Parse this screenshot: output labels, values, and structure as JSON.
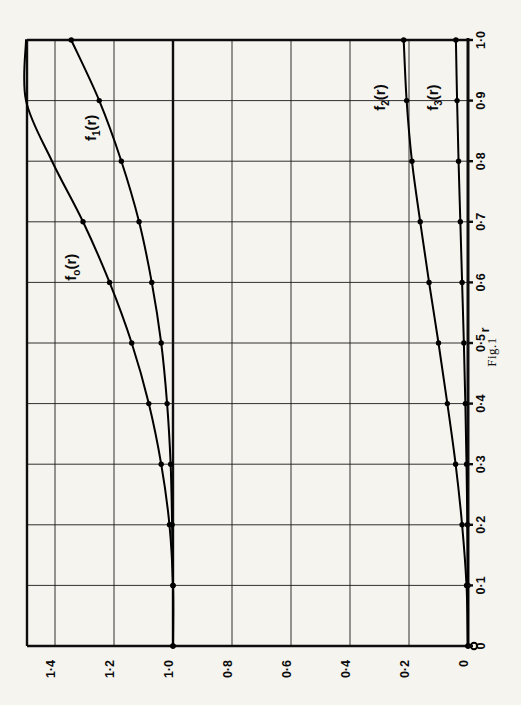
{
  "figure": {
    "caption": "Fig.1",
    "background_color": "#f6f4ef",
    "ink_color": "#000000",
    "orientation_note": "plot rendered rotated 90 degrees on the page"
  },
  "chart_data": {
    "type": "line",
    "title": "",
    "xlabel": "r",
    "ylabel": "",
    "xlim": [
      0,
      1.0
    ],
    "ylim": [
      0,
      1.5
    ],
    "grid": true,
    "legend": "inline-curve-labels",
    "x_tick_labels": [
      "0",
      "0·1",
      "0·2",
      "0·3",
      "0·4",
      "0·5",
      "0·6",
      "0·7",
      "0·8",
      "0·9",
      "1·0"
    ],
    "x_tick_values": [
      0,
      0.1,
      0.2,
      0.3,
      0.4,
      0.5,
      0.6,
      0.7,
      0.8,
      0.9,
      1.0
    ],
    "y_tick_labels": [
      "0",
      "0·2",
      "0·4",
      "0·6",
      "0·8",
      "1·0",
      "1·2",
      "1·4"
    ],
    "y_tick_values": [
      0,
      0.2,
      0.4,
      0.6,
      0.8,
      1.0,
      1.2,
      1.4
    ],
    "x": [
      0,
      0.1,
      0.2,
      0.3,
      0.4,
      0.5,
      0.6,
      0.7,
      0.8,
      0.9,
      1.0
    ],
    "series": [
      {
        "name": "f_0(r)",
        "label": "f",
        "label_sub": "o",
        "label_tail": "(r)",
        "values": [
          1.0,
          1.0,
          1.012,
          1.04,
          1.082,
          1.14,
          1.215,
          1.305,
          1.41,
          1.5,
          1.5
        ],
        "clipped_above": true,
        "marker_x": [
          0,
          0.1,
          0.2,
          0.3,
          0.4,
          0.5,
          0.6,
          0.7
        ],
        "marker_values": [
          1.0,
          1.0,
          1.012,
          1.04,
          1.082,
          1.14,
          1.215,
          1.305
        ]
      },
      {
        "name": "f_1(r)",
        "label": "f",
        "label_sub": "1",
        "label_tail": "(r)",
        "values": [
          1.0,
          1.0,
          1.003,
          1.008,
          1.02,
          1.04,
          1.072,
          1.115,
          1.175,
          1.25,
          1.345
        ],
        "clipped_above": false,
        "marker_x": [
          0,
          0.1,
          0.2,
          0.3,
          0.4,
          0.5,
          0.6,
          0.7,
          0.8,
          0.9,
          1.0
        ],
        "marker_values": [
          1.0,
          1.0,
          1.003,
          1.008,
          1.02,
          1.04,
          1.072,
          1.115,
          1.175,
          1.25,
          1.345
        ]
      },
      {
        "name": "f_2(r)",
        "label": "f",
        "label_sub": "2",
        "label_tail": "(r)",
        "values": [
          0.0,
          0.005,
          0.02,
          0.042,
          0.07,
          0.1,
          0.132,
          0.162,
          0.19,
          0.208,
          0.218
        ],
        "clipped_above": false,
        "marker_x": [
          0,
          0.1,
          0.2,
          0.3,
          0.4,
          0.5,
          0.6,
          0.7,
          0.8,
          0.9,
          1.0
        ],
        "marker_values": [
          0.0,
          0.005,
          0.02,
          0.042,
          0.07,
          0.1,
          0.132,
          0.162,
          0.19,
          0.208,
          0.218
        ]
      },
      {
        "name": "f_3(r)",
        "label": "f",
        "label_sub": "3",
        "label_tail": "(r)",
        "values": [
          0.0,
          0.0,
          0.002,
          0.005,
          0.009,
          0.014,
          0.02,
          0.026,
          0.032,
          0.037,
          0.041
        ],
        "clipped_above": false,
        "marker_x": [
          0,
          0.1,
          0.2,
          0.3,
          0.4,
          0.5,
          0.6,
          0.7,
          0.8,
          0.9,
          1.0
        ],
        "marker_values": [
          0.0,
          0.0,
          0.002,
          0.005,
          0.009,
          0.014,
          0.02,
          0.026,
          0.032,
          0.037,
          0.041
        ]
      }
    ]
  }
}
